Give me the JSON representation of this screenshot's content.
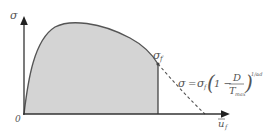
{
  "diagram": {
    "y_axis": {
      "label": "σ",
      "arrow": true
    },
    "x_axis": {
      "label_base": "u",
      "label_sub": "f",
      "overbar": true,
      "arrow": true
    },
    "origin_label": "0",
    "peak_point_label": {
      "base": "σ",
      "sub": "f"
    },
    "formula": {
      "lhs": "σ",
      "eq": "=",
      "sigma_f_base": "σ",
      "sigma_f_sub": "f",
      "paren_open": "(",
      "one_minus": "1 −",
      "numerator": "D",
      "denominator_base": "T",
      "denominator_sub": "max",
      "paren_close": ")",
      "exponent": "1/αd"
    },
    "colors": {
      "fill": "#d4d4d4",
      "curve": "#555555",
      "axis": "#333333",
      "dashed": "#555555"
    }
  }
}
